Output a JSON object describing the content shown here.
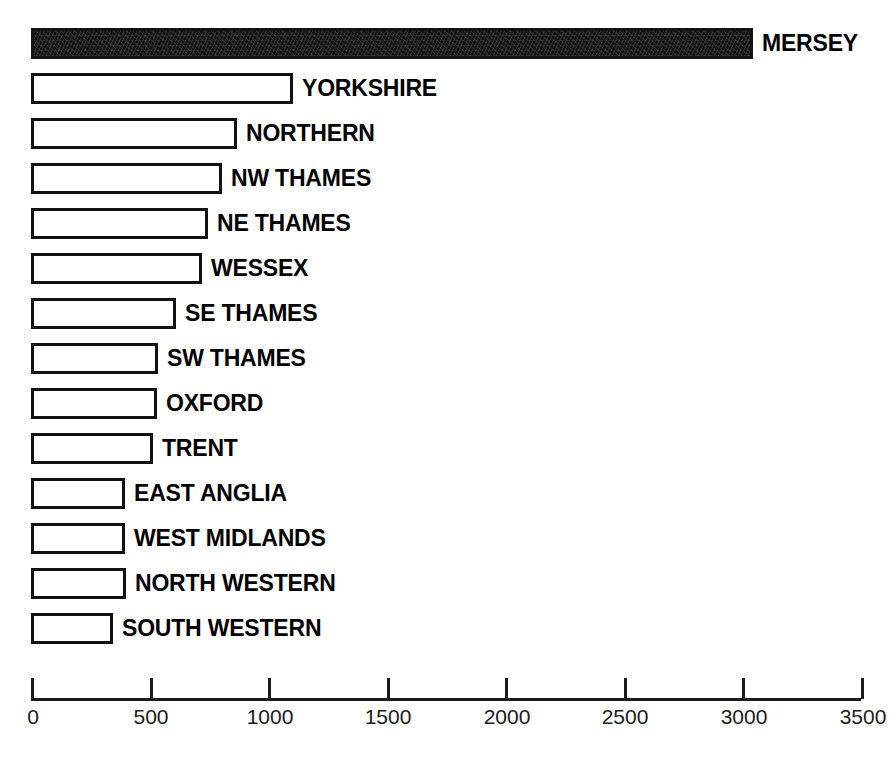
{
  "chart_data": {
    "type": "bar",
    "orientation": "horizontal",
    "title": "",
    "subtitle": "",
    "xlabel": "",
    "ylabel": "",
    "grid": false,
    "legend": null,
    "xlim": [
      0,
      3500
    ],
    "x_ticks": [
      0,
      500,
      1000,
      1500,
      2000,
      2500,
      3000,
      3500
    ],
    "x_tick_labels": [
      "0",
      "500",
      "1000",
      "1500",
      "2000",
      "2500",
      "3000",
      "3500"
    ],
    "categories": [
      "MERSEY",
      "YORKSHIRE",
      "NORTHERN",
      "NW THAMES",
      "NE THAMES",
      "WESSEX",
      "SE THAMES",
      "SW THAMES",
      "OXFORD",
      "TRENT",
      "EAST ANGLIA",
      "WEST MIDLANDS",
      "NORTH WESTERN",
      "SOUTH WESTERN"
    ],
    "values": [
      3045,
      1105,
      870,
      805,
      745,
      720,
      610,
      535,
      530,
      515,
      395,
      395,
      400,
      345
    ],
    "bar_styles": [
      "filled",
      "outline",
      "outline",
      "outline",
      "outline",
      "outline",
      "outline",
      "outline",
      "outline",
      "outline",
      "outline",
      "outline",
      "outline",
      "outline"
    ],
    "colors": {
      "filled_bar": "#141414",
      "outline_bar_fill": "#ffffff",
      "bar_stroke": "#111111",
      "axis": "#1b1b1b",
      "label_text": "#000000",
      "tick_text": "#1b1b1b",
      "background": "#ffffff"
    }
  },
  "layout": {
    "plot_left_px": 31,
    "plot_right_px": 861,
    "first_bar_top_px": 28,
    "row_pitch_px": 45,
    "bar_height_px": 31,
    "axis_top_px": 678
  }
}
